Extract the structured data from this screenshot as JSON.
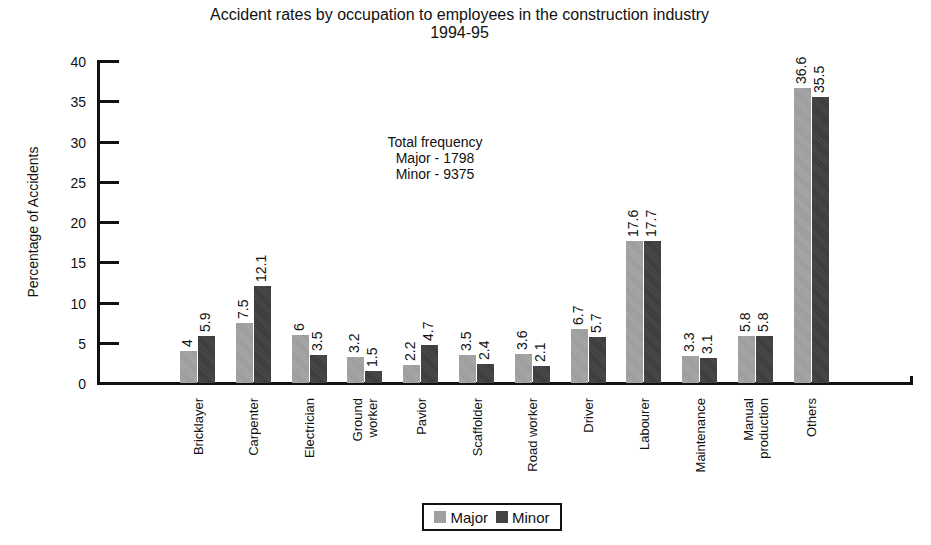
{
  "chart_data": {
    "type": "bar",
    "title": "Accident rates by occupation to employees in the construction industry",
    "subtitle": "1994-95",
    "xlabel": "",
    "ylabel": "Percentage of Accidents",
    "ylim": [
      0,
      40
    ],
    "yticks": [
      0,
      5,
      10,
      15,
      20,
      25,
      30,
      35,
      40
    ],
    "grid": false,
    "legend_position": "bottom",
    "categories": [
      "Bricklayer",
      "Carpenter",
      "Electrician",
      "Ground worker",
      "Pavior",
      "Scaffolder",
      "Road worker",
      "Driver",
      "Labourer",
      "Maintenance",
      "Manual production",
      "Others"
    ],
    "series": [
      {
        "name": "Major",
        "color": "#a0a0a0",
        "values": [
          4,
          7.5,
          6,
          3.2,
          2.2,
          3.5,
          3.6,
          6.7,
          17.6,
          3.3,
          5.8,
          36.6
        ]
      },
      {
        "name": "Minor",
        "color": "#444444",
        "values": [
          5.9,
          12.1,
          3.5,
          1.5,
          4.7,
          2.4,
          2.1,
          5.7,
          17.7,
          3.1,
          5.8,
          35.5
        ]
      }
    ],
    "annotations": [
      "Total frequency",
      "Major - 1798",
      "Minor - 9375"
    ]
  },
  "labels": {
    "title": "Accident rates by occupation to employees in the construction industry",
    "subtitle": "1994-95",
    "ylabel": "Percentage of Accidents",
    "annot_line1": "Total frequency",
    "annot_line2": "Major - 1798",
    "annot_line3": "Minor - 9375",
    "legend_major": "Major",
    "legend_minor": "Minor"
  }
}
